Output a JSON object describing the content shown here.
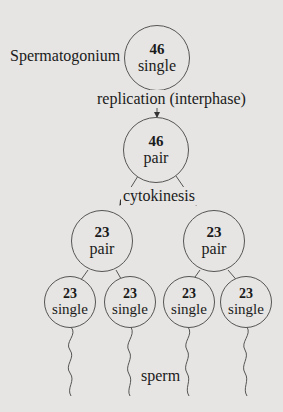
{
  "diagram": {
    "type": "flowchart",
    "colors": {
      "background": "#e6e5e3",
      "stroke": "#555555",
      "text": "#1a1a1a"
    },
    "labels": {
      "origin": "Spermatogonium",
      "step1": "replication (interphase)",
      "step2": "cytokinesis",
      "product": "sperm"
    },
    "nodes": [
      {
        "id": "spermatogonium",
        "count": "46",
        "ploidy": "single"
      },
      {
        "id": "primary",
        "count": "46",
        "ploidy": "pair"
      },
      {
        "id": "secondary-left",
        "count": "23",
        "ploidy": "pair"
      },
      {
        "id": "secondary-right",
        "count": "23",
        "ploidy": "pair"
      },
      {
        "id": "sperm-1",
        "count": "23",
        "ploidy": "single"
      },
      {
        "id": "sperm-2",
        "count": "23",
        "ploidy": "single"
      },
      {
        "id": "sperm-3",
        "count": "23",
        "ploidy": "single"
      },
      {
        "id": "sperm-4",
        "count": "23",
        "ploidy": "single"
      }
    ],
    "edges": [
      {
        "from": "spermatogonium",
        "to": "primary",
        "label": "replication (interphase)"
      },
      {
        "from": "primary",
        "to": "secondary-left",
        "label": "cytokinesis"
      },
      {
        "from": "primary",
        "to": "secondary-right",
        "label": "cytokinesis"
      },
      {
        "from": "secondary-left",
        "to": "sperm-1"
      },
      {
        "from": "secondary-left",
        "to": "sperm-2"
      },
      {
        "from": "secondary-right",
        "to": "sperm-3"
      },
      {
        "from": "secondary-right",
        "to": "sperm-4"
      }
    ]
  }
}
